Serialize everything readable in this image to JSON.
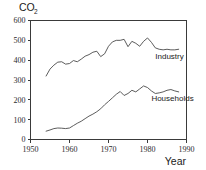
{
  "chart_data": {
    "type": "line",
    "title": "",
    "ylabel": "CO",
    "ylabel_subscript": "2",
    "xlabel": "Year",
    "xlim": [
      1950,
      1990
    ],
    "ylim": [
      0,
      600
    ],
    "grid": false,
    "legend_position": "inline-right",
    "xticks": [
      "1950",
      "1960",
      "1970",
      "1980",
      "1990"
    ],
    "xtick_values": [
      1950,
      1960,
      1970,
      1980,
      1990
    ],
    "yticks": [
      "0",
      "100",
      "200",
      "300",
      "400",
      "500",
      "600"
    ],
    "ytick_values": [
      0,
      100,
      200,
      300,
      400,
      500,
      600
    ],
    "series": [
      {
        "name": "Industry",
        "label": "Industry",
        "color": "#4a4a4a",
        "x": [
          1954,
          1955,
          1956,
          1957,
          1958,
          1959,
          1960,
          1961,
          1962,
          1963,
          1964,
          1965,
          1966,
          1967,
          1968,
          1969,
          1970,
          1971,
          1972,
          1973,
          1974,
          1975,
          1976,
          1977,
          1978,
          1979,
          1980,
          1981,
          1982,
          1983,
          1984,
          1985,
          1986,
          1987,
          1988
        ],
        "values": [
          320,
          355,
          375,
          390,
          392,
          380,
          383,
          398,
          392,
          405,
          420,
          428,
          440,
          445,
          418,
          432,
          470,
          492,
          500,
          500,
          505,
          468,
          495,
          485,
          470,
          495,
          512,
          490,
          462,
          455,
          452,
          455,
          452,
          452,
          455
        ]
      },
      {
        "name": "Households",
        "label": "Households",
        "color": "#4a4a4a",
        "x": [
          1954,
          1955,
          1956,
          1957,
          1958,
          1959,
          1960,
          1961,
          1962,
          1963,
          1964,
          1965,
          1966,
          1967,
          1968,
          1969,
          1970,
          1971,
          1972,
          1973,
          1974,
          1975,
          1976,
          1977,
          1978,
          1979,
          1980,
          1981,
          1982,
          1983,
          1984,
          1985,
          1986,
          1987,
          1988
        ],
        "values": [
          42,
          48,
          55,
          58,
          57,
          55,
          58,
          70,
          82,
          92,
          105,
          118,
          128,
          140,
          155,
          175,
          192,
          210,
          228,
          242,
          222,
          232,
          248,
          240,
          255,
          270,
          262,
          245,
          232,
          235,
          240,
          248,
          252,
          245,
          240
        ]
      }
    ],
    "annotations": [
      {
        "text": "Industry",
        "x": 1982,
        "y": 405
      },
      {
        "text": "Households",
        "x": 1981,
        "y": 195
      }
    ]
  },
  "axes": {
    "y_axis_name": "co2-axis",
    "x_axis_name": "year-axis"
  }
}
